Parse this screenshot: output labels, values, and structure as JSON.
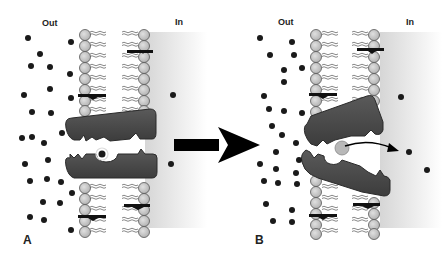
{
  "figure": {
    "arrow_between_panels": "right-arrow"
  },
  "panels": [
    {
      "id": "A",
      "label": "A",
      "out_label": "Out",
      "in_label": "In",
      "state": "carrier open to outside, solute bound",
      "membrane_x": [
        80,
        145
      ]
    },
    {
      "id": "B",
      "label": "B",
      "out_label": "Out",
      "in_label": "In",
      "state": "carrier tilted open to inside, solute released",
      "membrane_x": [
        315,
        378
      ]
    }
  ],
  "colors": {
    "protein": "#4a4a4a",
    "lipid_head": "#c8c8c8",
    "solute": "#1a1a1a",
    "inside_shade": "#d9d9d9",
    "arrow": "#000000"
  }
}
